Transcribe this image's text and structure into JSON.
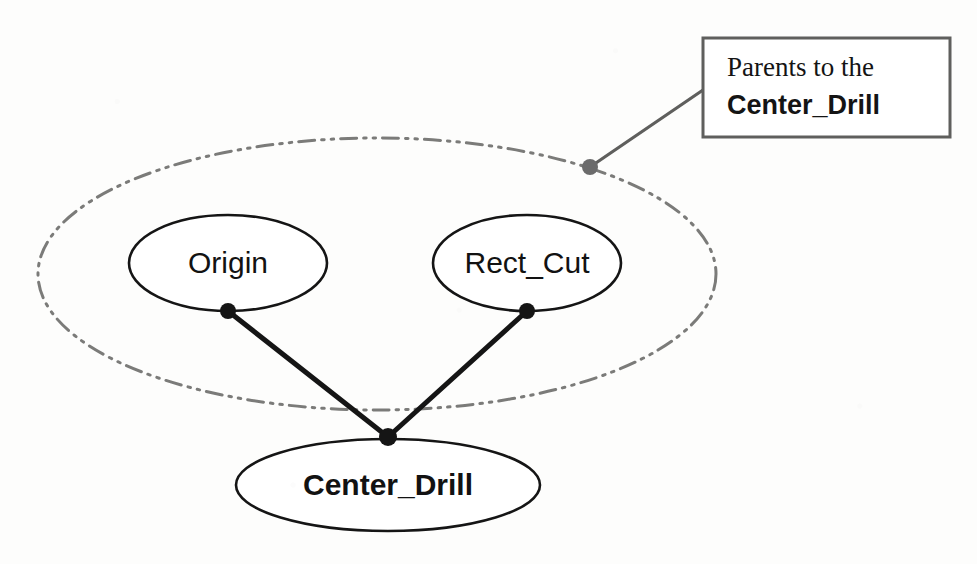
{
  "diagram": {
    "type": "feature-tree-parent-child",
    "background_color": "#fdfdfc",
    "group_boundary": {
      "name": "parents-group-boundary",
      "shape": "ellipse",
      "stroke_style": "dash-dot-dot",
      "stroke_color": "#7b7b79",
      "cx": 377,
      "cy": 274,
      "rx": 339,
      "ry": 136
    },
    "nodes": [
      {
        "id": "origin",
        "label": "Origin",
        "bold": false,
        "shape": "ellipse",
        "stroke_color": "#151515",
        "cx": 228,
        "cy": 263,
        "rx": 99,
        "ry": 48,
        "connector_dot": {
          "x": 228,
          "y": 311,
          "r": 8,
          "color": "#151515"
        }
      },
      {
        "id": "rect_cut",
        "label": "Rect_Cut",
        "bold": false,
        "shape": "ellipse",
        "stroke_color": "#151515",
        "cx": 527,
        "cy": 263,
        "rx": 94,
        "ry": 48,
        "connector_dot": {
          "x": 527,
          "y": 311,
          "r": 8,
          "color": "#151515"
        }
      },
      {
        "id": "center_drill",
        "label": "Center_Drill",
        "bold": true,
        "shape": "ellipse",
        "stroke_color": "#151515",
        "cx": 388,
        "cy": 485,
        "rx": 152,
        "ry": 46,
        "connector_dot": {
          "x": 388,
          "y": 437,
          "r": 9,
          "color": "#151515"
        }
      }
    ],
    "edges": [
      {
        "id": "edge-origin-center-drill",
        "from": "origin",
        "to": "center_drill",
        "x1": 228,
        "y1": 311,
        "x2": 388,
        "y2": 437,
        "color": "#151515"
      },
      {
        "id": "edge-rect-cut-center-drill",
        "from": "rect_cut",
        "to": "center_drill",
        "x1": 527,
        "y1": 311,
        "x2": 388,
        "y2": 437,
        "color": "#151515"
      }
    ],
    "callout": {
      "name": "parents-callout",
      "line1": "Parents to the",
      "line2": "Center_Drill",
      "box": {
        "x": 703,
        "y": 38,
        "width": 247,
        "height": 99,
        "stroke_color": "#5f5f5d",
        "fill": "#ffffff"
      },
      "leader": {
        "color": "#5f5f5d",
        "from_x": 590,
        "from_y": 167,
        "to_x": 703,
        "to_y": 90,
        "anchor_dot": {
          "x": 590,
          "y": 167,
          "r": 8,
          "color": "#6b6b6b"
        }
      }
    }
  }
}
